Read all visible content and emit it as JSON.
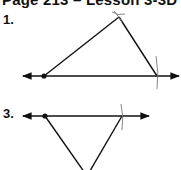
{
  "header": {
    "title": "Page 213 – Lesson 3-3D"
  },
  "problems": [
    {
      "label": "1.",
      "figure": "triangle-constructed-on-line-apex-up"
    },
    {
      "label": "3.",
      "figure": "triangle-constructed-on-line-apex-down"
    }
  ],
  "colors": {
    "ink": "#111111",
    "arc": "#777777",
    "background": "#ffffff"
  }
}
